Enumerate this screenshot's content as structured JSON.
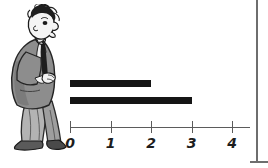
{
  "illustration": {
    "name": "cartoon-man-in-suit",
    "description": "hand-drawn hunched man in grey suit with tie, facing right toward the chart",
    "colors": {
      "jacket": "#8d8d8d",
      "jacket_shadow": "#6f6f6f",
      "trousers": "#b3b3b3",
      "skin": "#f2f2f2",
      "ink": "#1a1a1a",
      "shoe": "#4a4a4a"
    }
  },
  "frame": {
    "color": "#6e6e6e"
  },
  "chart_data": {
    "type": "bar",
    "orientation": "horizontal",
    "title": "",
    "xlabel": "",
    "ylabel": "",
    "categories": [
      "top",
      "bottom"
    ],
    "values": [
      2,
      3
    ],
    "x": [
      0,
      1,
      2,
      3,
      4
    ],
    "tick_labels": [
      "0",
      "1",
      "2",
      "3",
      "4"
    ],
    "xlim": [
      0,
      4
    ],
    "grid": false,
    "legend": false,
    "bar_color": "#151515",
    "axis_color": "#5b5b5b",
    "label_color": "#1d1d1d"
  }
}
